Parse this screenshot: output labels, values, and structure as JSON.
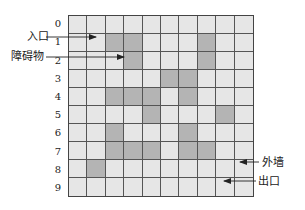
{
  "diagram": {
    "type": "maze-grid",
    "rows": 10,
    "cols": 10,
    "row_labels": [
      "0",
      "1",
      "2",
      "3",
      "4",
      "5",
      "6",
      "7",
      "8",
      "9"
    ],
    "obstacles": [
      [
        1,
        2
      ],
      [
        1,
        3
      ],
      [
        1,
        7
      ],
      [
        2,
        3
      ],
      [
        2,
        7
      ],
      [
        3,
        5
      ],
      [
        3,
        6
      ],
      [
        4,
        2
      ],
      [
        4,
        3
      ],
      [
        4,
        4
      ],
      [
        4,
        6
      ],
      [
        5,
        4
      ],
      [
        5,
        8
      ],
      [
        6,
        2
      ],
      [
        6,
        6
      ],
      [
        7,
        2
      ],
      [
        7,
        3
      ],
      [
        7,
        4
      ],
      [
        7,
        6
      ],
      [
        7,
        7
      ],
      [
        8,
        1
      ]
    ],
    "colors": {
      "cell": "#e6e6e6",
      "obstacle": "#b4b4b4",
      "grid_line": "#555555"
    },
    "annotations": {
      "entrance": "入口",
      "obstacle": "障碍物",
      "outer_wall": "外墙",
      "exit": "出口"
    }
  }
}
